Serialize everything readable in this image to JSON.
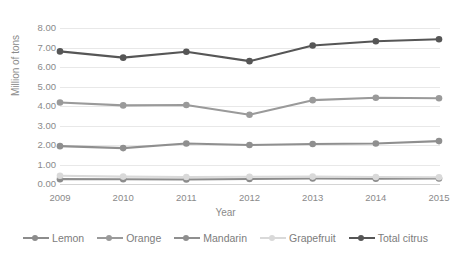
{
  "chart_data": {
    "type": "line",
    "title": "",
    "xlabel": "Year",
    "ylabel": "Million of tons",
    "categories": [
      "2009",
      "2010",
      "2011",
      "2012",
      "2013",
      "2014",
      "2015"
    ],
    "ylim": [
      0.0,
      8.0
    ],
    "ytick_labels": [
      "8.00",
      "7.00",
      "6.00",
      "5.00",
      "4.00",
      "3.00",
      "2.00",
      "1.00",
      "0.00"
    ],
    "ytick_values": [
      8.0,
      7.0,
      6.0,
      5.0,
      4.0,
      3.0,
      2.0,
      1.0,
      0.0
    ],
    "grid": true,
    "legend_position": "bottom",
    "series": [
      {
        "name": "Lemon",
        "color": "#8c8c8c",
        "values": [
          0.25,
          0.24,
          0.23,
          0.26,
          0.28,
          0.27,
          0.28
        ]
      },
      {
        "name": "Orange",
        "color": "#9a9a9a",
        "values": [
          4.18,
          4.03,
          4.05,
          3.55,
          4.3,
          4.42,
          4.4
        ]
      },
      {
        "name": "Mandarin",
        "color": "#8f8f8f",
        "values": [
          1.94,
          1.84,
          2.08,
          2.0,
          2.05,
          2.08,
          2.2
        ]
      },
      {
        "name": "Grapefruit",
        "color": "#d9d9d9",
        "values": [
          0.42,
          0.38,
          0.36,
          0.37,
          0.38,
          0.36,
          0.35
        ]
      },
      {
        "name": "Total citrus",
        "color": "#565656",
        "values": [
          6.8,
          6.48,
          6.78,
          6.3,
          7.1,
          7.32,
          7.42
        ]
      }
    ]
  }
}
